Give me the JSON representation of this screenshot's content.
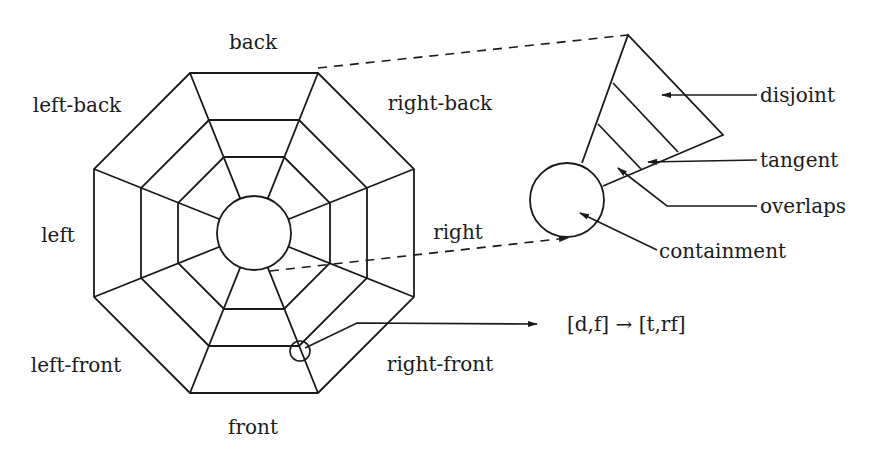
{
  "diagram": {
    "colors": {
      "line": "#1a1a1a",
      "background": "#ffffff"
    },
    "octagon": {
      "center": [
        254,
        233
      ],
      "rings": [
        {
          "apothem": 160,
          "half_edge": 64
        },
        {
          "apothem": 113,
          "half_edge": 45
        },
        {
          "apothem": 76,
          "half_edge": 30
        }
      ],
      "inner_circle_radius": 37
    },
    "direction_labels": [
      {
        "text": "back",
        "x": 253,
        "y": 42
      },
      {
        "text": "right-back",
        "x": 440,
        "y": 103
      },
      {
        "text": "right",
        "x": 458,
        "y": 232
      },
      {
        "text": "right-front",
        "x": 440,
        "y": 364
      },
      {
        "text": "front",
        "x": 253,
        "y": 427
      },
      {
        "text": "left-front",
        "x": 76,
        "y": 365
      },
      {
        "text": "left",
        "x": 58,
        "y": 235
      },
      {
        "text": "left-back",
        "x": 77,
        "y": 105
      }
    ],
    "sector_detail": {
      "apex": [
        628,
        35
      ],
      "right_vertex": [
        723,
        135
      ],
      "left_base": [
        582,
        163
      ],
      "bottom_base": [
        603,
        186
      ],
      "circle": {
        "cx": 567,
        "cy": 200,
        "r": 37
      },
      "dividers": [
        [
          [
            613,
            83
          ],
          [
            678,
            152
          ]
        ],
        [
          [
            598,
            124
          ],
          [
            641,
            169
          ]
        ]
      ]
    },
    "zoom_dashed_lines": [
      {
        "from": [
          318,
          68
        ],
        "to": [
          628,
          35
        ]
      },
      {
        "from": [
          270,
          271
        ],
        "to": [
          568,
          238
        ]
      }
    ],
    "relation_labels": [
      {
        "text": "disjoint",
        "x": 760,
        "y": 95,
        "arrow": [
          [
            757,
            95
          ],
          [
            662,
            95
          ]
        ]
      },
      {
        "text": "tangent",
        "x": 760,
        "y": 160,
        "arrow": [
          [
            757,
            160
          ],
          [
            648,
            162
          ]
        ]
      },
      {
        "text": "overlaps",
        "x": 760,
        "y": 206,
        "arrow": [
          [
            757,
            206
          ],
          [
            667,
            206
          ],
          [
            618,
            168
          ]
        ]
      },
      {
        "text": "containment",
        "x": 659,
        "y": 251,
        "arrow": [
          [
            657,
            250
          ],
          [
            580,
            213
          ]
        ]
      }
    ],
    "transition": {
      "marker": {
        "cx": 300,
        "cy": 351,
        "r": 10
      },
      "arrow": [
        [
          305,
          348
        ],
        [
          357,
          323
        ],
        [
          537,
          324
        ]
      ],
      "text": "[d,f] → [t,rf]",
      "x": 567,
      "y": 324
    }
  }
}
